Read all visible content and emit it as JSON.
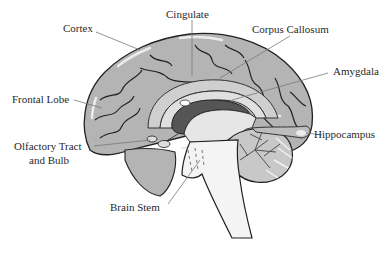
{
  "diagram": {
    "type": "anatomical-sagittal-brain",
    "colors": {
      "cortex_fill": "#b4b4b4",
      "cortex_highlight": "#e6e6e6",
      "outline": "#222222",
      "ventricle": "#555555",
      "inner_light": "#d2d2d2",
      "stem_fill": "#f4f4f4",
      "leader_line": "#777777",
      "label_text": "#2a2a2a"
    },
    "labels": [
      {
        "id": "cortex",
        "text": "Cortex"
      },
      {
        "id": "cingulate",
        "text": "Cingulate"
      },
      {
        "id": "corpus-callosum",
        "text": "Corpus Callosum"
      },
      {
        "id": "amygdala",
        "text": "Amygdala"
      },
      {
        "id": "frontal-lobe",
        "text": "Frontal Lobe"
      },
      {
        "id": "hippocampus",
        "text": "Hippocampus"
      },
      {
        "id": "olfactory-line1",
        "text": "Olfactory Tract"
      },
      {
        "id": "olfactory-line2",
        "text": "and Bulb"
      },
      {
        "id": "brain-stem",
        "text": "Brain Stem"
      }
    ]
  }
}
